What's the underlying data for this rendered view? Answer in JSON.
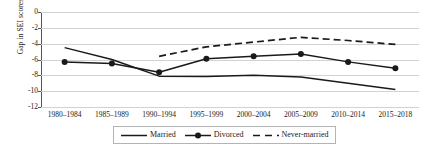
{
  "chart_data": {
    "type": "line",
    "title": "",
    "xlabel": "",
    "ylabel": "Gap in SEI scores",
    "ylim": [
      -12,
      0
    ],
    "ytick_labels": [
      "0",
      "-2",
      "-4",
      "-6",
      "-8",
      "-10",
      "-12"
    ],
    "ytick_values": [
      0,
      -2,
      -4,
      -6,
      -8,
      -10,
      -12
    ],
    "grid": true,
    "legend_position": "bottom",
    "categories": [
      "1980–1984",
      "1985–1989",
      "1990–1994",
      "1995–1999",
      "2000–2004",
      "2005–2009",
      "2010–2014",
      "2015–2018"
    ],
    "series": [
      {
        "name": "Married",
        "style": "solid",
        "marker": "none",
        "color": "#1a1a1a",
        "values": [
          -4.5,
          -6.0,
          -8.1,
          -8.15,
          -8.0,
          -8.2,
          -9.0,
          -9.8
        ]
      },
      {
        "name": "Divorced",
        "style": "solid",
        "marker": "circle",
        "color": "#1a1a1a",
        "values": [
          -6.3,
          -6.5,
          -7.6,
          -5.9,
          -5.6,
          -5.3,
          -6.3,
          -7.1
        ]
      },
      {
        "name": "Never-married",
        "style": "dashed",
        "marker": "none",
        "color": "#1a1a1a",
        "values": [
          null,
          null,
          -5.6,
          -4.4,
          -3.8,
          -3.2,
          -3.6,
          -4.1
        ]
      }
    ]
  },
  "legend": {
    "items": [
      {
        "label": "Married"
      },
      {
        "label": "Divorced"
      },
      {
        "label": "Never-married"
      }
    ]
  }
}
